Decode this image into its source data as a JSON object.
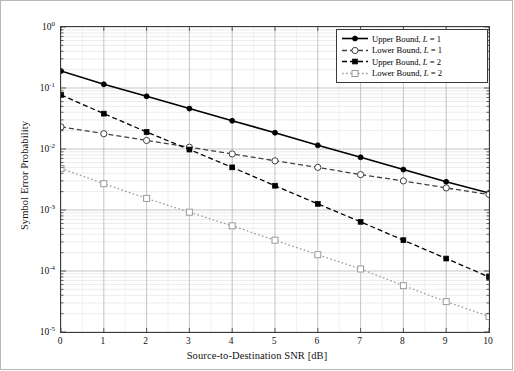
{
  "chart_data": {
    "type": "line",
    "title": "",
    "xlabel": "Source-to-Destination SNR [dB]",
    "ylabel": "Symbol Error Probability",
    "xlim": [
      0,
      10
    ],
    "ylim": [
      1e-05,
      1
    ],
    "yscale": "log",
    "xscale": "linear",
    "grid": true,
    "legend_position": "upper right",
    "xticks": [
      "0",
      "1",
      "2",
      "3",
      "4",
      "5",
      "6",
      "7",
      "8",
      "9",
      "10"
    ],
    "x": [
      0,
      1,
      2,
      3,
      4,
      5,
      6,
      7,
      8,
      9,
      10
    ],
    "yticks": [
      {
        "exp": "0",
        "value": 1
      },
      {
        "exp": "-1",
        "value": 0.1
      },
      {
        "exp": "-2",
        "value": 0.01
      },
      {
        "exp": "-3",
        "value": 0.001
      },
      {
        "exp": "-4",
        "value": 0.0001
      },
      {
        "exp": "-5",
        "value": 1e-05
      }
    ],
    "series": [
      {
        "name": "Upper Bound, L = 1",
        "label_prefix": "Upper Bound, ",
        "label_var": "L",
        "label_suffix": " = 1",
        "linestyle": "solid",
        "marker": "filled-circle",
        "color": "#000000",
        "values": [
          0.19,
          0.115,
          0.073,
          0.046,
          0.029,
          0.0185,
          0.0115,
          0.0073,
          0.0046,
          0.0029,
          0.0019
        ]
      },
      {
        "name": "Lower Bound, L = 1",
        "label_prefix": "Lower Bound, ",
        "label_var": "L",
        "label_suffix": " = 1",
        "linestyle": "dashed",
        "marker": "open-circle",
        "color": "#404040",
        "values": [
          0.023,
          0.0178,
          0.0138,
          0.0107,
          0.0083,
          0.0064,
          0.005,
          0.0038,
          0.003,
          0.0023,
          0.0018
        ]
      },
      {
        "name": "Upper Bound, L = 2",
        "label_prefix": "Upper Bound, ",
        "label_var": "L",
        "label_suffix": " = 2",
        "linestyle": "dashed",
        "marker": "filled-square",
        "color": "#000000",
        "values": [
          0.077,
          0.038,
          0.019,
          0.0098,
          0.005,
          0.0025,
          0.00126,
          0.00064,
          0.00032,
          0.00016,
          8e-05
        ]
      },
      {
        "name": "Lower Bound, L = 2",
        "label_prefix": "Lower Bound, ",
        "label_var": "L",
        "label_suffix": " = 2",
        "linestyle": "dotted",
        "marker": "open-square",
        "color": "#9a9a9a",
        "values": [
          0.0048,
          0.0027,
          0.00155,
          0.00092,
          0.00055,
          0.00032,
          0.000185,
          0.000108,
          5.75e-05,
          3.15e-05,
          1.8e-05
        ]
      }
    ]
  }
}
